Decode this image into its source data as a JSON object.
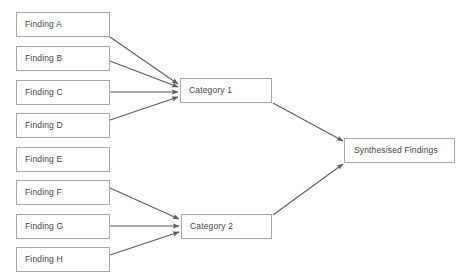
{
  "diagram": {
    "background_color": "#ffffff",
    "border_color": "#a6a6a6",
    "text_color": "#3f3f3f",
    "arrow_color": "#595959",
    "findings": [
      {
        "label": "Finding A",
        "x": 16,
        "y": 12,
        "w": 94,
        "h": 25
      },
      {
        "label": "Finding B",
        "x": 16,
        "y": 46,
        "w": 94,
        "h": 25
      },
      {
        "label": "Finding C",
        "x": 16,
        "y": 80,
        "w": 94,
        "h": 25
      },
      {
        "label": "Finding D",
        "x": 16,
        "y": 113,
        "w": 94,
        "h": 25
      },
      {
        "label": "Finding E",
        "x": 16,
        "y": 147,
        "w": 94,
        "h": 25
      },
      {
        "label": "Finding F",
        "x": 16,
        "y": 180,
        "w": 94,
        "h": 25
      },
      {
        "label": "Finding G",
        "x": 16,
        "y": 214,
        "w": 94,
        "h": 25
      },
      {
        "label": "Finding H",
        "x": 16,
        "y": 247,
        "w": 94,
        "h": 25
      }
    ],
    "categories": [
      {
        "label": "Category 1",
        "x": 180,
        "y": 78,
        "w": 92,
        "h": 25
      },
      {
        "label": "Category 2",
        "x": 181,
        "y": 214,
        "w": 91,
        "h": 25
      }
    ],
    "synthesis": {
      "label": "Synthesised Findings",
      "x": 344,
      "y": 138,
      "w": 111,
      "h": 25
    },
    "edges": [
      {
        "from": "Finding A",
        "to": "Category 1",
        "x1": 110,
        "y1": 37,
        "x2": 178,
        "y2": 84
      },
      {
        "from": "Finding B",
        "to": "Category 1",
        "x1": 110,
        "y1": 61,
        "x2": 178,
        "y2": 87
      },
      {
        "from": "Finding C",
        "to": "Category 1",
        "x1": 110,
        "y1": 92,
        "x2": 178,
        "y2": 92
      },
      {
        "from": "Finding D",
        "to": "Category 1",
        "x1": 110,
        "y1": 120,
        "x2": 178,
        "y2": 97
      },
      {
        "from": "Finding F",
        "to": "Category 2",
        "x1": 110,
        "y1": 188,
        "x2": 179,
        "y2": 219
      },
      {
        "from": "Finding G",
        "to": "Category 2",
        "x1": 110,
        "y1": 226,
        "x2": 179,
        "y2": 226
      },
      {
        "from": "Finding H",
        "to": "Category 2",
        "x1": 110,
        "y1": 255,
        "x2": 179,
        "y2": 232
      },
      {
        "from": "Category 1",
        "to": "Synthesised Findings",
        "x1": 273,
        "y1": 103,
        "x2": 343,
        "y2": 141
      },
      {
        "from": "Category 2",
        "to": "Synthesised Findings",
        "x1": 273,
        "y1": 215,
        "x2": 343,
        "y2": 164
      }
    ],
    "unconnected_nodes": [
      "Finding E"
    ]
  }
}
